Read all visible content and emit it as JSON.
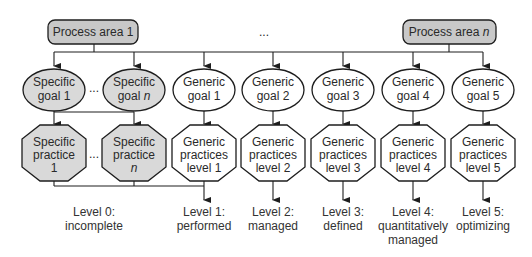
{
  "colors": {
    "stroke": "#1e1e1e",
    "shaded_fill": "#d9d9d9",
    "process_fill": "#c8c8c8",
    "white_fill": "#ffffff",
    "text": "#2a2a2a"
  },
  "process_areas": [
    {
      "label": "Process area 1"
    },
    {
      "label": "Process area ",
      "italic": "n"
    }
  ],
  "ellipsis_top": "...",
  "goals": [
    {
      "line1": "Specific",
      "line2": "goal 1",
      "shaded": true
    },
    {
      "line1": "Specific",
      "line2": "goal ",
      "italic": "n",
      "shaded": true
    },
    {
      "line1": "Generic",
      "line2": "goal 1",
      "shaded": false
    },
    {
      "line1": "Generic",
      "line2": "goal 2",
      "shaded": false
    },
    {
      "line1": "Generic",
      "line2": "goal 3",
      "shaded": false
    },
    {
      "line1": "Generic",
      "line2": "goal 4",
      "shaded": false
    },
    {
      "line1": "Generic",
      "line2": "goal 5",
      "shaded": false
    }
  ],
  "goal_ellipsis": "...",
  "practices": [
    {
      "line1": "Specific",
      "line2": "practice",
      "line3": "1",
      "shaded": true
    },
    {
      "line1": "Specific",
      "line2": "practice",
      "line3": "n",
      "shaded": true
    },
    {
      "line1": "Generic",
      "line2": "practices",
      "line3": "level 1",
      "shaded": false
    },
    {
      "line1": "Generic",
      "line2": "practices",
      "line3": "level 2",
      "shaded": false
    },
    {
      "line1": "Generic",
      "line2": "practices",
      "line3": "level 3",
      "shaded": false
    },
    {
      "line1": "Generic",
      "line2": "practices",
      "line3": "level 4",
      "shaded": false
    },
    {
      "line1": "Generic",
      "line2": "practices",
      "line3": "level 5",
      "shaded": false
    }
  ],
  "practice_ellipsis": "...",
  "levels": [
    {
      "line1": "Level 0:",
      "line2": "incomplete"
    },
    {
      "line1": "Level 1:",
      "line2": "performed"
    },
    {
      "line1": "Level 2:",
      "line2": "managed"
    },
    {
      "line1": "Level 3:",
      "line2": "defined"
    },
    {
      "line1": "Level 4:",
      "line2": "quantitatively",
      "line3": "managed"
    },
    {
      "line1": "Level 5:",
      "line2": "optimizing"
    }
  ]
}
